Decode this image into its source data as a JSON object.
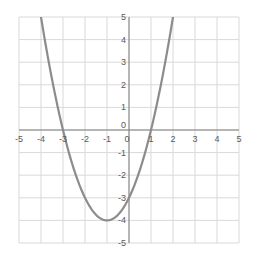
{
  "chart_data": {
    "type": "line",
    "title": "",
    "xlabel": "",
    "ylabel": "",
    "xlim": [
      -5,
      5
    ],
    "ylim": [
      -5,
      5
    ],
    "grid": true,
    "legend": null,
    "x_ticks": [
      "-5",
      "-4",
      "-3",
      "-2",
      "-1",
      "0",
      "1",
      "2",
      "3",
      "4",
      "5"
    ],
    "y_ticks": [
      "5",
      "4",
      "3",
      "2",
      "1",
      "0",
      "-1",
      "-2",
      "-3",
      "-4",
      "-5"
    ],
    "series": [
      {
        "name": "y = x^2 + 2x - 3",
        "color": "#8c8c8c",
        "x": [
          -4.16,
          -4,
          -3.5,
          -3,
          -2.5,
          -2,
          -1.5,
          -1,
          -0.5,
          0,
          0.5,
          1,
          1.5,
          2,
          2.16
        ],
        "y": [
          5.0,
          5,
          1.25,
          0,
          -1.75,
          -3,
          -3.75,
          -4,
          -3.75,
          -3,
          -1.75,
          0,
          2.25,
          5,
          5.0
        ]
      }
    ],
    "annotations": {
      "roots": [
        -3,
        1
      ],
      "vertex": [
        -1,
        -4
      ],
      "y_intercept": -3
    }
  },
  "colors": {
    "grid": "#d9d9d9",
    "axis": "#7f7f7f",
    "curve": "#8c8c8c",
    "tick_text": "#595959"
  }
}
